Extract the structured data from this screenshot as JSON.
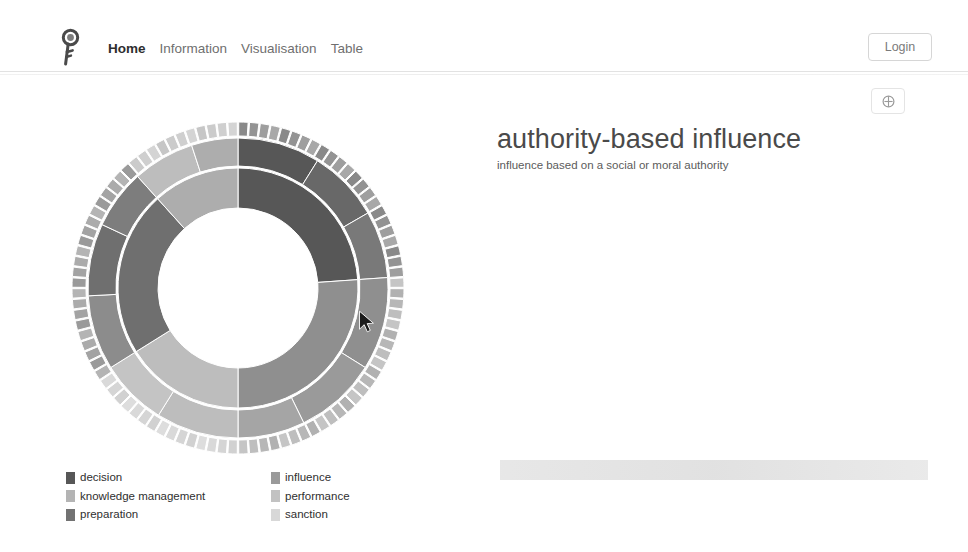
{
  "navbar": {
    "logo_icon": "key-logo-icon",
    "links": [
      {
        "label": "Home",
        "active": true
      },
      {
        "label": "Information",
        "active": false
      },
      {
        "label": "Visualisation",
        "active": false
      },
      {
        "label": "Table",
        "active": false
      }
    ],
    "login_label": "Login"
  },
  "toolbar": {
    "icon_button_name": "help-toggle-icon"
  },
  "main": {
    "title": "authority-based influence",
    "subtitle": "influence based on a social or moral authority"
  },
  "chart_data": {
    "type": "pie",
    "variant": "sunburst",
    "title": "authority-based influence",
    "legend_position": "bottom-left",
    "center_hole": true,
    "rings": 3,
    "categories": [
      "decision",
      "influence",
      "knowledge management",
      "performance",
      "preparation",
      "sanction"
    ],
    "colors": {
      "decision": "#575757",
      "influence": "#8f8f8f",
      "knowledge management": "#adadad",
      "performance": "#bdbdbd",
      "preparation": "#6f6f6f",
      "sanction": "#d6d6d6"
    },
    "inner_ring": [
      {
        "name": "decision",
        "value": 24,
        "start_deg": 0,
        "end_deg": 86
      },
      {
        "name": "influence",
        "value": 26,
        "start_deg": 86,
        "end_deg": 180
      },
      {
        "name": "performance",
        "value": 16,
        "start_deg": 180,
        "end_deg": 238
      },
      {
        "name": "preparation",
        "value": 22,
        "start_deg": 238,
        "end_deg": 318
      },
      {
        "name": "knowledge management",
        "value": 12,
        "start_deg": 318,
        "end_deg": 360
      }
    ],
    "middle_ring": [
      {
        "parent": "decision",
        "value": 9,
        "start_deg": 0,
        "end_deg": 32
      },
      {
        "parent": "decision",
        "value": 8,
        "start_deg": 32,
        "end_deg": 60
      },
      {
        "parent": "decision",
        "value": 7,
        "start_deg": 60,
        "end_deg": 86
      },
      {
        "parent": "influence",
        "value": 10,
        "start_deg": 86,
        "end_deg": 122
      },
      {
        "parent": "influence",
        "value": 9,
        "start_deg": 122,
        "end_deg": 154
      },
      {
        "parent": "influence",
        "value": 7,
        "start_deg": 154,
        "end_deg": 180
      },
      {
        "parent": "performance",
        "value": 9,
        "start_deg": 180,
        "end_deg": 212
      },
      {
        "parent": "performance",
        "value": 7,
        "start_deg": 212,
        "end_deg": 238
      },
      {
        "parent": "preparation",
        "value": 8,
        "start_deg": 238,
        "end_deg": 267
      },
      {
        "parent": "preparation",
        "value": 8,
        "start_deg": 267,
        "end_deg": 295
      },
      {
        "parent": "preparation",
        "value": 6,
        "start_deg": 295,
        "end_deg": 318
      },
      {
        "parent": "knowledge management",
        "value": 7,
        "start_deg": 318,
        "end_deg": 342
      },
      {
        "parent": "knowledge management",
        "value": 5,
        "start_deg": 342,
        "end_deg": 360
      }
    ],
    "outer_ring_segment_count": 96
  },
  "legend": {
    "items": [
      {
        "label": "decision",
        "color": "#575757"
      },
      {
        "label": "influence",
        "color": "#9a9a9a"
      },
      {
        "label": "knowledge management",
        "color": "#b4b4b4"
      },
      {
        "label": "performance",
        "color": "#c2c2c2"
      },
      {
        "label": "preparation",
        "color": "#727272"
      },
      {
        "label": "sanction",
        "color": "#d8d8d8"
      }
    ]
  }
}
